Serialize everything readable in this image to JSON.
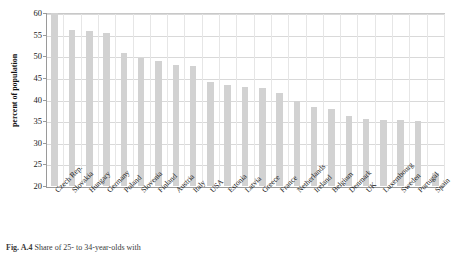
{
  "figure": {
    "caption_label": "Fig. A.4",
    "caption_text": "Share of 25- to 34-year-olds with"
  },
  "chart_data": {
    "type": "bar",
    "title": "",
    "xlabel": "",
    "ylabel": "percent of population",
    "ylim": [
      20,
      60
    ],
    "yticks": [
      20,
      25,
      30,
      35,
      40,
      45,
      50,
      55,
      60
    ],
    "grid": true,
    "legend": "none",
    "bar_color": "#d2d2d2",
    "categories": [
      "Czech Rep.",
      "Slovakia",
      "Hungary",
      "Germany",
      "Poland",
      "Slovenia",
      "Finland",
      "Austria",
      "Italy",
      "USA",
      "Estonia",
      "Latvia",
      "Greece",
      "France",
      "Netherlands",
      "Ireland",
      "Belgium",
      "Denmark",
      "UK",
      "Luxembourg",
      "Sweden",
      "Portugal",
      "Spain"
    ],
    "values": [
      60.0,
      56.1,
      55.8,
      55.4,
      50.8,
      49.7,
      48.8,
      47.9,
      47.7,
      44.1,
      43.3,
      42.9,
      42.6,
      41.4,
      39.6,
      38.2,
      37.7,
      36.2,
      35.4,
      35.3,
      35.2,
      35.0,
      23.0
    ]
  }
}
